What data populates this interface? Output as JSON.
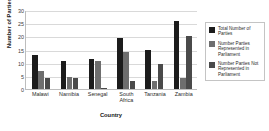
{
  "chart_data": {
    "type": "bar",
    "title": "",
    "xlabel": "Country",
    "ylabel": "Number of Parties",
    "ylim": [
      0,
      30
    ],
    "yticks": [
      0,
      5,
      10,
      15,
      20,
      25,
      30
    ],
    "grid": true,
    "legend_position": "right",
    "categories": [
      "Malawi",
      "Namibia",
      "Senegal",
      "South Africa",
      "Tanzania",
      "Zambia"
    ],
    "category_lines": [
      [
        "Malawi"
      ],
      [
        "Namibia"
      ],
      [
        "Senegal"
      ],
      [
        "South",
        "Africa"
      ],
      [
        "Tanzania"
      ],
      [
        "Zambia"
      ]
    ],
    "series": [
      {
        "name": "Total Number of Parties",
        "color": "#1c1c1c",
        "values": [
          13,
          10.5,
          11.5,
          19.5,
          15,
          26
        ]
      },
      {
        "name": "Number Parties Represented in Parliament",
        "color": "#6e6e6e",
        "values": [
          7,
          4.5,
          10.5,
          14,
          3,
          4
        ]
      },
      {
        "name": "Number Parties Not Represented in Parliament",
        "color": "#4a4a4a",
        "values": [
          4,
          4,
          0.3,
          3,
          9.5,
          20
        ]
      }
    ]
  },
  "legend": {
    "items": [
      {
        "label": "Total Number of Parties"
      },
      {
        "label": "Number Parties Represented in Parliament"
      },
      {
        "label": "Number Parties Not Represented in Parliament"
      }
    ]
  }
}
